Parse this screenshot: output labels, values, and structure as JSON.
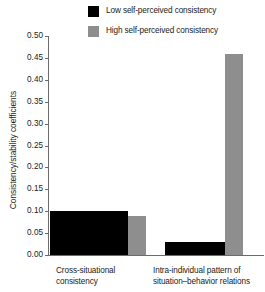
{
  "chart_data": {
    "type": "bar",
    "title": "",
    "subtitle": "",
    "xlabel": "",
    "ylabel": "Consistency/stability coefficients",
    "ylim": [
      0.0,
      0.5
    ],
    "ytick_labels": [
      "0.50",
      "0.45",
      "0.40",
      "0.35",
      "0.30",
      "0.25",
      "0.20",
      "0.15",
      "0.10",
      "0.05",
      "0.00"
    ],
    "ytick_values": [
      0.5,
      0.45,
      0.4,
      0.35,
      0.3,
      0.25,
      0.2,
      0.15,
      0.1,
      0.05,
      0.0
    ],
    "grid": false,
    "legend_position": "top-right",
    "categories": [
      "Cross-situational consistency",
      "Intra-individual pattern of situation–behavior relations"
    ],
    "category_lines": [
      [
        "Cross-situational",
        "consistency"
      ],
      [
        "Intra-individual pattern of",
        "situation–behavior relations"
      ]
    ],
    "series": [
      {
        "name": "Low self-perceived consistency",
        "color": "#000000",
        "values": [
          0.1,
          0.03
        ]
      },
      {
        "name": "High self-perceived consistency",
        "color": "#8e8e8e",
        "values": [
          0.09,
          0.46
        ]
      }
    ]
  },
  "legend": {
    "items": [
      {
        "label": "Low self-perceived consistency",
        "color": "#000000"
      },
      {
        "label": "High self-perceived consistency",
        "color": "#8e8e8e"
      }
    ]
  },
  "axes": {
    "y_title": "Consistency/stability coefficients",
    "y_ticks": [
      "0.50",
      "0.45",
      "0.40",
      "0.35",
      "0.30",
      "0.25",
      "0.20",
      "0.15",
      "0.10",
      "0.05",
      "0.00"
    ],
    "axis_color": "#6b6b6b"
  },
  "x_categories": {
    "g1_line1": "Cross-situational",
    "g1_line2": "consistency",
    "g2_line1": "Intra-individual pattern of",
    "g2_line2": "situation–behavior relations"
  }
}
